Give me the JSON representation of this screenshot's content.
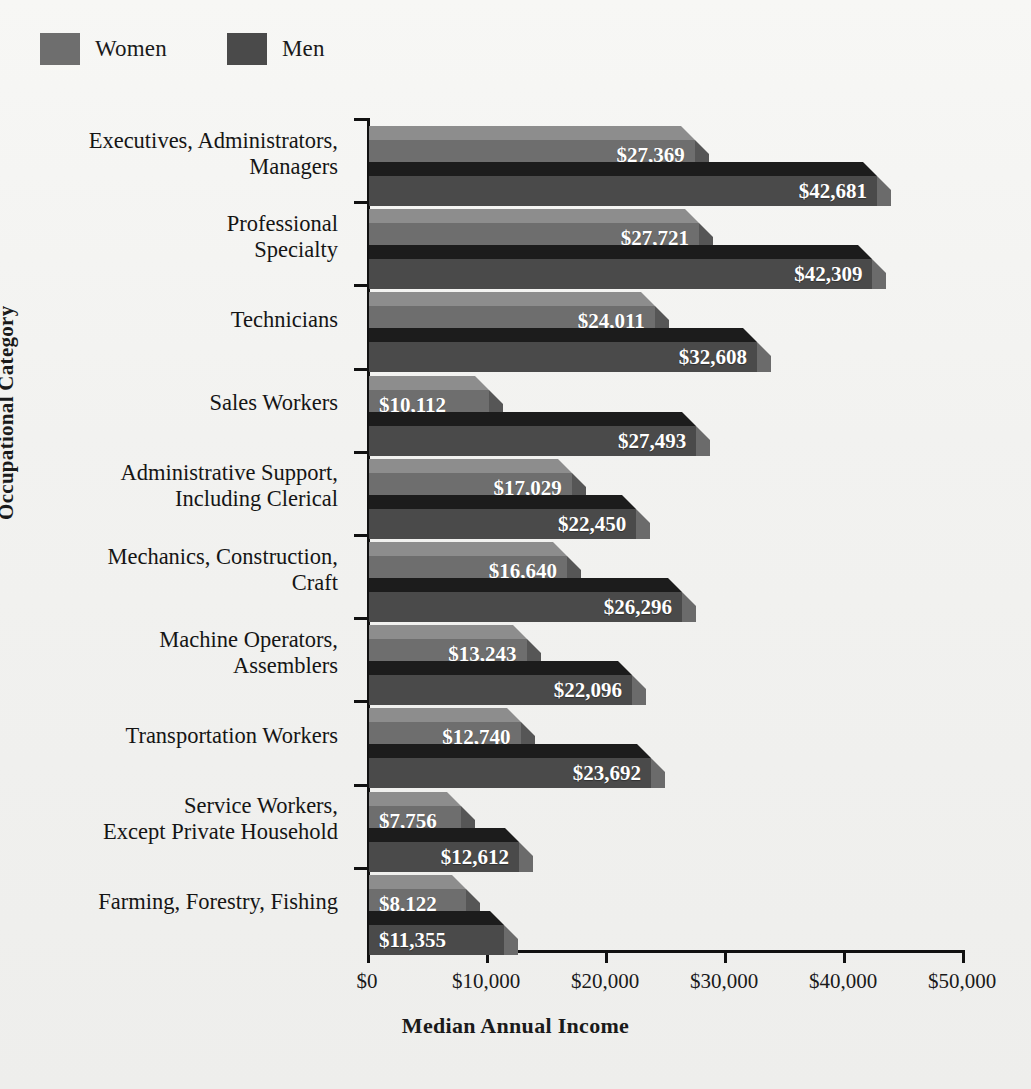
{
  "legend": {
    "items": [
      {
        "label": "Women",
        "color": "#6e6e6e"
      },
      {
        "label": "Men",
        "color": "#4a4a4a"
      }
    ]
  },
  "axes": {
    "ylabel": "Occupational Category",
    "xlabel": "Median Annual Income",
    "xticks": [
      "$0",
      "$10,000",
      "$20,000",
      "$30,000",
      "$40,000",
      "$50,000"
    ],
    "xtick_values": [
      0,
      10000,
      20000,
      30000,
      40000,
      50000
    ],
    "xlim": [
      0,
      50000
    ]
  },
  "chart_data": {
    "type": "bar",
    "orientation": "horizontal",
    "title": "",
    "xlabel": "Median Annual Income",
    "ylabel": "Occupational Category",
    "xlim": [
      0,
      50000
    ],
    "grid": false,
    "legend_position": "top-left",
    "categories": [
      "Executives, Administrators,\nManagers",
      "Professional\nSpecialty",
      "Technicians",
      "Sales Workers",
      "Administrative Support,\nIncluding Clerical",
      "Mechanics, Construction,\nCraft",
      "Machine Operators,\nAssemblers",
      "Transportation Workers",
      "Service Workers,\nExcept Private Household",
      "Farming, Forestry, Fishing"
    ],
    "series": [
      {
        "name": "Women",
        "color": "#6e6e6e",
        "values": [
          27369,
          27721,
          24011,
          10112,
          17029,
          16640,
          13243,
          12740,
          7756,
          8122
        ],
        "labels": [
          "$27,369",
          "$27,721",
          "$24,011",
          "$10,112",
          "$17,029",
          "$16,640",
          "$13,243",
          "$12,740",
          "$7,756",
          "$8,122"
        ]
      },
      {
        "name": "Men",
        "color": "#4a4a4a",
        "values": [
          42681,
          42309,
          32608,
          27493,
          22450,
          26296,
          22096,
          23692,
          12612,
          11355
        ],
        "labels": [
          "$42,681",
          "$42,309",
          "$32,608",
          "$27,493",
          "$22,450",
          "$26,296",
          "$22,096",
          "$23,692",
          "$12,612",
          "$11,355"
        ]
      }
    ]
  }
}
